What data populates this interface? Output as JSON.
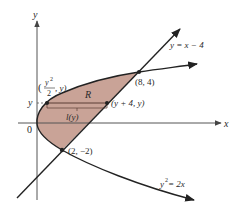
{
  "diagram": {
    "colors": {
      "region_fill": "#c9a397",
      "curve_stroke": "#222222",
      "axis_stroke": "#555555",
      "background": "#ffffff"
    },
    "axes": {
      "x_label": "x",
      "y_label": "y",
      "origin_label": "0"
    },
    "curves": [
      {
        "id": "line",
        "label": "y = x − 4"
      },
      {
        "id": "parabola",
        "label_base": "y",
        "label_exp": "2",
        "label_rest": " = 2x"
      }
    ],
    "points": [
      {
        "id": "upper-intersection",
        "label": "(8, 4)"
      },
      {
        "id": "lower-intersection",
        "label": "(2, −2)"
      },
      {
        "id": "left-point",
        "label_open": "(",
        "label_num": "y",
        "label_num_exp": "2",
        "label_den": "2",
        "label_close": ", y)"
      },
      {
        "id": "right-point",
        "label": "(y + 4, y)"
      }
    ],
    "region": {
      "label": "R"
    },
    "strip": {
      "level_label": "y",
      "length_label": "l(y)"
    }
  }
}
